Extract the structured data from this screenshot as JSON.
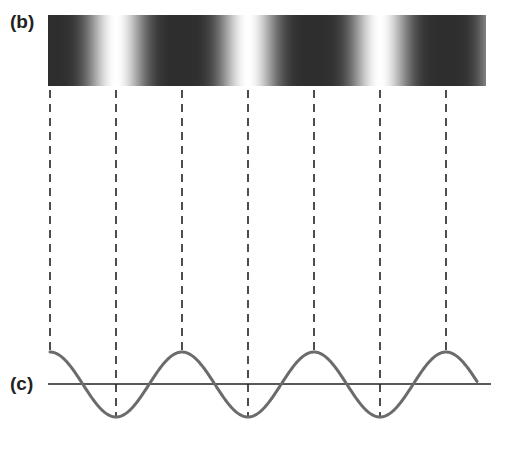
{
  "panel_b": {
    "label": "(b)",
    "description": "interference fringe intensity pattern",
    "bar": {
      "x": 48,
      "y": 15,
      "width": 438,
      "height": 71
    },
    "dark_fringe_x": [
      50,
      182,
      314,
      446
    ],
    "bright_fringe_x": [
      116,
      248,
      380
    ],
    "colors": {
      "dark": "#2e2e2e",
      "bright": "#ffffff"
    }
  },
  "guides": {
    "style": "dashed",
    "color": "#222222",
    "top_y": 90,
    "to_peak": {
      "x": [
        50,
        182,
        314,
        446
      ],
      "end_y": 352
    },
    "to_trough": {
      "x": [
        116,
        248,
        380
      ],
      "end_y": 417
    }
  },
  "panel_c": {
    "label": "(c)",
    "description": "sinusoidal wave corresponding to fringe pattern",
    "axis": {
      "x1": 48,
      "x2": 491,
      "y": 384,
      "color": "#222222"
    },
    "wave": {
      "x_start": 50,
      "x_end": 477,
      "center_y": 384.5,
      "amplitude_px": 32.5,
      "period_px": 132,
      "peaks_x": [
        50,
        182,
        314,
        446
      ],
      "troughs_x": [
        116,
        248,
        380
      ],
      "color": "#6b6b6b",
      "stroke_width": 3
    }
  }
}
